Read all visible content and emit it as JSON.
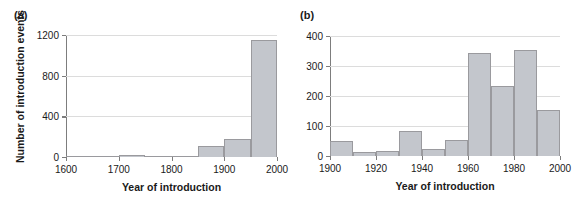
{
  "figure": {
    "background_color": "#ffffff",
    "bar_fill_color": "#c3c6cc",
    "bar_edge_color": "#9a9a9e",
    "grid_color": "#dcdcdc",
    "axis_color": "#7d7d7d"
  },
  "panels": [
    {
      "label": "(a)",
      "xlabel": "Year of introduction",
      "ylabel": "Number of introduction events"
    },
    {
      "label": "(b)",
      "xlabel": "Year of introduction",
      "ylabel": ""
    }
  ],
  "chart_data": [
    {
      "type": "bar",
      "title": "(a)",
      "xlabel": "Year of introduction",
      "ylabel": "Number of introduction events",
      "bin_width": 50,
      "categories": [
        "1600-1650",
        "1650-1700",
        "1700-1750",
        "1750-1800",
        "1800-1850",
        "1850-1900",
        "1900-1950",
        "1950-2000"
      ],
      "bin_starts": [
        1600,
        1650,
        1700,
        1750,
        1800,
        1850,
        1900,
        1950
      ],
      "values": [
        2,
        3,
        20,
        8,
        3,
        110,
        175,
        1150
      ],
      "xlim": [
        1600,
        2000
      ],
      "ylim": [
        0,
        1200
      ],
      "xticks": [
        1600,
        1700,
        1800,
        1900,
        2000
      ],
      "xticklabels": [
        "1600",
        "1700",
        "1800",
        "1900",
        "2000"
      ],
      "yticks": [
        0,
        400,
        800,
        1200
      ],
      "yticklabels": [
        "0",
        "400",
        "800",
        "1200"
      ],
      "grid": "horizontal",
      "legend": "none"
    },
    {
      "type": "bar",
      "title": "(b)",
      "xlabel": "Year of introduction",
      "ylabel": "",
      "bin_width": 10,
      "categories": [
        "1900-1910",
        "1910-1920",
        "1920-1930",
        "1930-1940",
        "1940-1950",
        "1950-1960",
        "1960-1970",
        "1970-1980",
        "1980-1990",
        "1990-2000"
      ],
      "bin_starts": [
        1900,
        1910,
        1920,
        1930,
        1940,
        1950,
        1960,
        1970,
        1980,
        1990
      ],
      "values": [
        50,
        13,
        17,
        82,
        23,
        55,
        345,
        232,
        352,
        155
      ],
      "xlim": [
        1900,
        2000
      ],
      "ylim": [
        0,
        400
      ],
      "xticks": [
        1900,
        1920,
        1940,
        1960,
        1980,
        2000
      ],
      "xticklabels": [
        "1900",
        "1920",
        "1940",
        "1960",
        "1980",
        "2000"
      ],
      "yticks": [
        0,
        100,
        200,
        300,
        400
      ],
      "yticklabels": [
        "0",
        "100",
        "200",
        "300",
        "400"
      ],
      "grid": "horizontal",
      "legend": "none"
    }
  ]
}
